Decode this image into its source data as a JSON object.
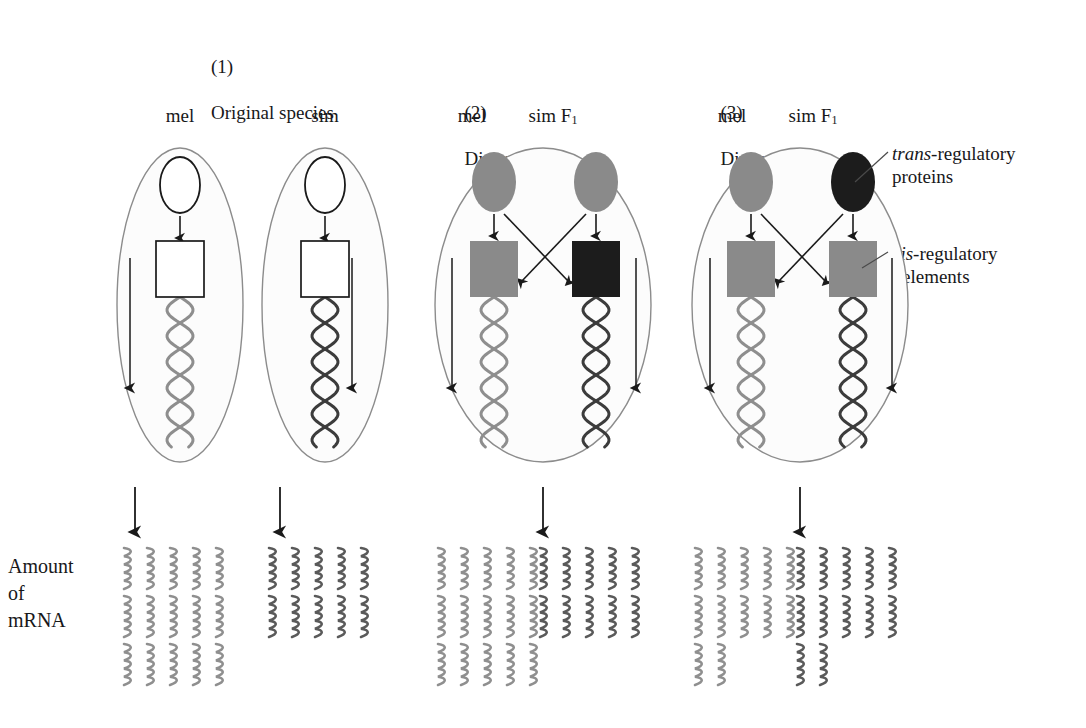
{
  "figure": {
    "background": "#ffffff",
    "ink": "#18181a",
    "colors": {
      "cell_outline": "#8c8c8c",
      "nucleus_outline": "#1a1a1a",
      "mel_gray": "#8a8a8a",
      "sim_black": "#1c1c1c",
      "mel_helix": "#8e8e8e",
      "sim_helix": "#3c3c3c",
      "box_outline": "#1a1a1a",
      "arrow": "#1a1a1a",
      "leader": "#4a4a4a",
      "mrna_light": "#8f8f8f",
      "mrna_dark": "#5a5a5a"
    }
  },
  "panels": [
    {
      "id": "panel-1",
      "number": "(1)",
      "title_line1": "Original species",
      "title_line2": "",
      "title_italic_prefix": "",
      "cells": [
        {
          "id": "p1-mel",
          "label": "mel",
          "label_sub": "",
          "protein_fill": "none",
          "cis_fill": "none",
          "helix_shade": "light",
          "mrna_rows": 3,
          "mrna_per_row": 5,
          "mrna_shade": "light"
        },
        {
          "id": "p1-sim",
          "label": "sim",
          "label_sub": "",
          "protein_fill": "none",
          "cis_fill": "none",
          "helix_shade": "dark",
          "mrna_rows": 2,
          "mrna_per_row": 5,
          "mrna_shade": "dark"
        }
      ]
    },
    {
      "id": "panel-2",
      "number": "(2)",
      "title_line1": "Divergence in",
      "title_italic_prefix": "cis",
      "title_line2": "-regulation",
      "cells": [
        {
          "id": "p2-mel",
          "label": "mel",
          "label_sub": "",
          "protein_fill": "gray",
          "cis_fill": "gray",
          "helix_shade": "light",
          "mrna_rows": 3,
          "mrna_per_row": 5,
          "mrna_shade": "light"
        },
        {
          "id": "p2-sim",
          "label": "sim F",
          "label_sub": "1",
          "protein_fill": "gray",
          "cis_fill": "black",
          "helix_shade": "dark",
          "mrna_rows": 2,
          "mrna_per_row": 5,
          "mrna_shade": "dark"
        }
      ]
    },
    {
      "id": "panel-3",
      "number": "(3)",
      "title_line1": "Divergence in",
      "title_italic_prefix": "trans",
      "title_line2": "-regulation",
      "cells": [
        {
          "id": "p3-mel",
          "label": "mel",
          "label_sub": "",
          "protein_fill": "gray",
          "cis_fill": "gray",
          "helix_shade": "light",
          "mrna_rows": 2,
          "mrna_per_row": 5,
          "mrna_shade": "light",
          "mrna_last_row_count": 2
        },
        {
          "id": "p3-sim",
          "label": "sim F",
          "label_sub": "1",
          "protein_fill": "black",
          "cis_fill": "gray",
          "helix_shade": "dark",
          "mrna_rows": 2,
          "mrna_per_row": 5,
          "mrna_shade": "dark",
          "mrna_last_row_count": 2
        }
      ]
    }
  ],
  "annotations": [
    {
      "id": "trans-regulatory-proteins",
      "italic": "trans",
      "rest": "-regulatory",
      "line2": "proteins"
    },
    {
      "id": "cis-regulatory-elements",
      "italic": "cis",
      "rest": "-regulatory",
      "line2": "elements"
    }
  ],
  "axis_label": {
    "line1": "Amount",
    "line2": "of",
    "line3": "mRNA"
  },
  "chart_data": {
    "type": "bar",
    "title": "Amount of mRNA",
    "ylabel": "Amount of mRNA",
    "xlabel": "",
    "units": "mRNA squiggle glyphs",
    "categories": [
      "(1) mel",
      "(1) sim",
      "(2) mel",
      "(2) sim F1",
      "(3) mel",
      "(3) sim F1"
    ],
    "values": [
      15,
      10,
      15,
      10,
      12,
      12
    ],
    "rows": [
      3,
      2,
      3,
      2,
      2,
      2
    ],
    "glyphs_per_row": [
      [
        5,
        5,
        5
      ],
      [
        5,
        5
      ],
      [
        5,
        5,
        5
      ],
      [
        5,
        5
      ],
      [
        5,
        5,
        2
      ],
      [
        5,
        5,
        2
      ]
    ],
    "ylim": [
      0,
      16
    ],
    "grid": false,
    "legend": false
  }
}
